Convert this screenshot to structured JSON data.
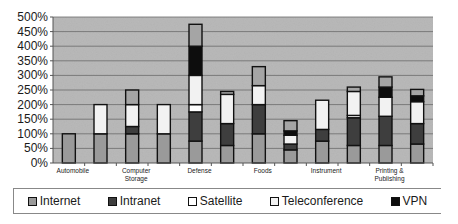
{
  "chart_data": {
    "type": "bar",
    "stacked": true,
    "title": "",
    "xlabel": "",
    "ylabel": "",
    "ylim": [
      0,
      500
    ],
    "yticks": [
      "0%",
      "50%",
      "100%",
      "150%",
      "200%",
      "250%",
      "300%",
      "350%",
      "400%",
      "450%",
      "500%"
    ],
    "grid": true,
    "legend_position": "bottom",
    "categories": [
      "Automobile",
      "",
      "Computer Storage",
      "",
      "Defense",
      "",
      "Foods",
      "",
      "Instrument",
      "",
      "Printing & Publishing",
      ""
    ],
    "category_labels": [
      {
        "line1": "Automobile",
        "line2": ""
      },
      {
        "line1": "",
        "line2": ""
      },
      {
        "line1": "Computer",
        "line2": "Storage"
      },
      {
        "line1": "",
        "line2": ""
      },
      {
        "line1": "Defense",
        "line2": ""
      },
      {
        "line1": "",
        "line2": ""
      },
      {
        "line1": "Foods",
        "line2": ""
      },
      {
        "line1": "",
        "line2": ""
      },
      {
        "line1": "Instrument",
        "line2": ""
      },
      {
        "line1": "",
        "line2": ""
      },
      {
        "line1": "Printing &",
        "line2": "Publishing"
      },
      {
        "line1": "",
        "line2": ""
      }
    ],
    "series": [
      {
        "name": "Internet",
        "color": "#9a9a9a",
        "values": [
          100,
          100,
          100,
          100,
          75,
          60,
          100,
          45,
          75,
          60,
          60,
          65
        ]
      },
      {
        "name": "Intranet",
        "color": "#3e3e3e",
        "values": [
          0,
          0,
          25,
          0,
          100,
          75,
          100,
          20,
          40,
          95,
          100,
          70
        ]
      },
      {
        "name": "Satellite",
        "color": "#ffffff",
        "values": [
          0,
          0,
          0,
          0,
          25,
          0,
          0,
          0,
          0,
          8,
          0,
          0
        ]
      },
      {
        "name": "Teleconference",
        "color": "#f2f2f2",
        "values": [
          0,
          100,
          75,
          100,
          100,
          100,
          65,
          30,
          100,
          82,
          65,
          75
        ]
      },
      {
        "name": "VPN",
        "color": "#0d0d0d",
        "values": [
          0,
          0,
          0,
          0,
          100,
          0,
          0,
          15,
          0,
          0,
          35,
          20
        ]
      },
      {
        "name": "Other",
        "color": "#a5a5a5",
        "values": [
          0,
          0,
          50,
          0,
          75,
          10,
          65,
          35,
          0,
          15,
          35,
          22
        ],
        "in_legend": false
      }
    ]
  },
  "legend": [
    {
      "label": "Internet",
      "color": "#9a9a9a"
    },
    {
      "label": "Intranet",
      "color": "#3e3e3e"
    },
    {
      "label": "Satellite",
      "color": "#ffffff"
    },
    {
      "label": "Teleconference",
      "color": "#f2f2f2"
    },
    {
      "label": "VPN",
      "color": "#0d0d0d"
    }
  ]
}
